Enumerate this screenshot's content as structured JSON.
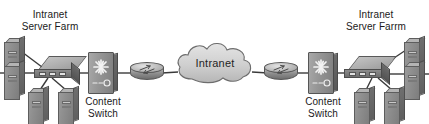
{
  "diagram": {
    "background": "#ffffff",
    "line_color": "#3a3a3a",
    "labels": {
      "left_farm": "Intranet\nServer Farm",
      "right_farm": "Intranet\nServer Farrm",
      "left_content_switch": "Content\nSwitch",
      "right_content_switch": "Content\nSwitch",
      "cloud": "Intranet"
    },
    "nodes": [
      {
        "id": "srv-l1",
        "type": "server",
        "icon": "server-tower-icon",
        "side": "left"
      },
      {
        "id": "srv-l2",
        "type": "server",
        "icon": "server-tower-icon",
        "side": "left"
      },
      {
        "id": "srv-l3",
        "type": "server",
        "icon": "server-tower-icon",
        "side": "left"
      },
      {
        "id": "srv-l4",
        "type": "server",
        "icon": "server-tower-icon",
        "side": "left"
      },
      {
        "id": "sw-l",
        "type": "switch",
        "icon": "lan-switch-icon",
        "side": "left"
      },
      {
        "id": "cs-l",
        "type": "content-switch",
        "icon": "content-switch-icon",
        "side": "left"
      },
      {
        "id": "rt-l",
        "type": "router",
        "icon": "router-icon",
        "side": "left"
      },
      {
        "id": "cloud",
        "type": "cloud",
        "icon": "cloud-icon",
        "side": "center"
      },
      {
        "id": "rt-r",
        "type": "router",
        "icon": "router-icon",
        "side": "right"
      },
      {
        "id": "cs-r",
        "type": "content-switch",
        "icon": "content-switch-icon",
        "side": "right"
      },
      {
        "id": "sw-r",
        "type": "switch",
        "icon": "lan-switch-icon",
        "side": "right"
      },
      {
        "id": "srv-r1",
        "type": "server",
        "icon": "server-tower-icon",
        "side": "right"
      },
      {
        "id": "srv-r2",
        "type": "server",
        "icon": "server-tower-icon",
        "side": "right"
      },
      {
        "id": "srv-r3",
        "type": "server",
        "icon": "server-tower-icon",
        "side": "right"
      },
      {
        "id": "srv-r4",
        "type": "server",
        "icon": "server-tower-icon",
        "side": "right"
      }
    ],
    "links": [
      {
        "from": "srv-l1",
        "to": "sw-l"
      },
      {
        "from": "srv-l2",
        "to": "sw-l"
      },
      {
        "from": "sw-l",
        "to": "srv-l3"
      },
      {
        "from": "sw-l",
        "to": "srv-l4"
      },
      {
        "from": "sw-l",
        "to": "cs-l"
      },
      {
        "from": "cs-l",
        "to": "rt-l"
      },
      {
        "from": "rt-l",
        "to": "cloud"
      },
      {
        "from": "cloud",
        "to": "rt-r"
      },
      {
        "from": "rt-r",
        "to": "cs-r"
      },
      {
        "from": "cs-r",
        "to": "sw-r"
      },
      {
        "from": "sw-r",
        "to": "srv-r1"
      },
      {
        "from": "sw-r",
        "to": "srv-r2"
      },
      {
        "from": "sw-r",
        "to": "srv-r3"
      },
      {
        "from": "sw-r",
        "to": "srv-r4"
      }
    ]
  }
}
